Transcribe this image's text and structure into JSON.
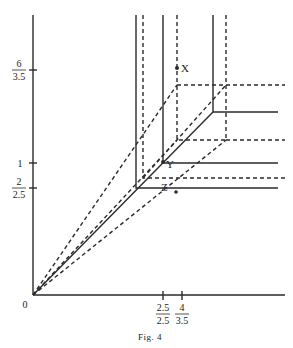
{
  "figure": {
    "caption": "Fig. 4",
    "origin_label": "0",
    "y_ticks": [
      {
        "num": "6",
        "den": "3.5",
        "y": 70
      },
      {
        "value": "1",
        "y": 163
      },
      {
        "num": "2",
        "den": "2.5",
        "y": 188
      }
    ],
    "x_ticks": [
      {
        "num": "2.5",
        "den": "2.5",
        "x": 163
      },
      {
        "num": "4",
        "den": "3.5",
        "x": 182
      }
    ],
    "points": [
      {
        "label": "X",
        "x": 177,
        "y": 68
      },
      {
        "label": "Y",
        "x": 163,
        "y": 162
      },
      {
        "label": "Z",
        "x": 176,
        "y": 192
      }
    ],
    "line_color": "#2a2a2a"
  }
}
